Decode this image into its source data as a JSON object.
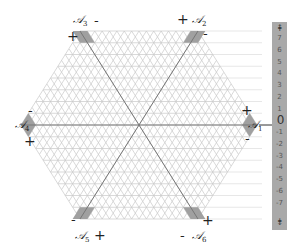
{
  "diagram": {
    "type": "hexagonal-triangular-lattice",
    "colors": {
      "grid": "#c8c8c8",
      "axis": "#777777",
      "marker": "#a0a0a0",
      "scale_bar": "#a9a9a9",
      "reference_line": "#dddddd"
    },
    "vertices": [
      {
        "id": "A1",
        "label": "𝒜",
        "sub": "1",
        "plus": "+",
        "minus": "-"
      },
      {
        "id": "A2",
        "label": "𝒜",
        "sub": "2",
        "plus": "+",
        "minus": "-"
      },
      {
        "id": "A3",
        "label": "𝒜",
        "sub": "3",
        "plus": "+",
        "minus": "-"
      },
      {
        "id": "A4",
        "label": "𝒜",
        "sub": "4",
        "plus": "+",
        "minus": "-"
      },
      {
        "id": "A5",
        "label": "𝒜",
        "sub": "5",
        "plus": "+",
        "minus": "-"
      },
      {
        "id": "A6",
        "label": "𝒜",
        "sub": "6",
        "plus": "+",
        "minus": "-"
      }
    ],
    "scale": {
      "top_arrow": "⇞",
      "bottom_arrow": "⇟",
      "ticks": [
        "7",
        "6",
        "5",
        "4",
        "3",
        "2",
        "1",
        "0",
        "-1",
        "-2",
        "-3",
        "-4",
        "-5",
        "-6",
        "-7"
      ]
    }
  }
}
